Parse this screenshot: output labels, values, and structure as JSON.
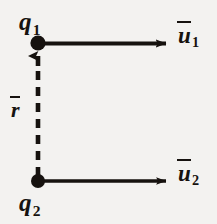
{
  "figure": {
    "type": "physics-vector-diagram",
    "background_color": "#f3f2f0",
    "ink_color": "#16120f",
    "width": 217,
    "height": 224
  },
  "labels": {
    "q1": {
      "base": "q",
      "subscript": "1",
      "overbar": false
    },
    "q2": {
      "base": "q",
      "subscript": "2",
      "overbar": false
    },
    "u1": {
      "base": "u",
      "subscript": "1",
      "overbar": true
    },
    "u2": {
      "base": "u",
      "subscript": "2",
      "overbar": true
    },
    "r": {
      "base": "r",
      "subscript": "",
      "overbar": true
    }
  },
  "points": [
    {
      "name": "charge-q1",
      "label": "q1",
      "x": 38,
      "y": 43,
      "radius": 7.5
    },
    {
      "name": "charge-q2",
      "label": "q2",
      "x": 38,
      "y": 181,
      "radius": 7.0
    }
  ],
  "vectors": [
    {
      "name": "velocity-u1",
      "label": "u1",
      "from_x": 38,
      "from_y": 43,
      "to_x": 168,
      "to_y": 43,
      "direction": "right",
      "style": "solid",
      "line_width": 4.0
    },
    {
      "name": "velocity-u2",
      "label": "u2",
      "from_x": 38,
      "from_y": 181,
      "to_x": 168,
      "to_y": 181,
      "direction": "right",
      "style": "solid",
      "line_width": 3.2
    },
    {
      "name": "separation-r",
      "label": "r",
      "from_x": 38,
      "from_y": 181,
      "to_x": 38,
      "to_y": 52,
      "direction": "up",
      "style": "dashed",
      "line_width": 4.5,
      "dash_pattern": "9 7"
    }
  ]
}
